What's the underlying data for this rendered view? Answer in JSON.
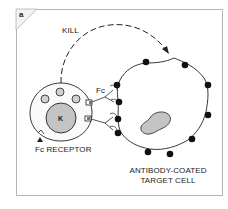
{
  "panel": {
    "letter": "a"
  },
  "labels": {
    "kill": "KILL",
    "fc": "Fc",
    "k": "K",
    "fc_receptor": "Fc RECEPTOR",
    "target_line1": "ANTIBODY-COATED",
    "target_line2": "TARGET CELL"
  },
  "colors": {
    "frame": "#b5b5b5",
    "stroke": "#222222",
    "nucleus_fill": "#c4c4c4",
    "granule_fill": "#d0d0d0",
    "antigen_dot": "#111111",
    "receptor_fill": "#777777"
  }
}
